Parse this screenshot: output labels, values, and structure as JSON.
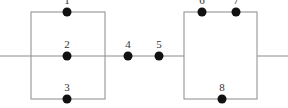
{
  "diagram": {
    "type": "reliability-block-network",
    "main_line_y": 56,
    "left_block": {
      "x1": 31,
      "x2": 105,
      "top": 12,
      "bottom": 99
    },
    "right_block": {
      "x1": 184,
      "x2": 257,
      "top": 12,
      "bottom": 99
    },
    "nodes": [
      {
        "id": "1",
        "label": "1",
        "x": 67,
        "y": 12
      },
      {
        "id": "2",
        "label": "2",
        "x": 67,
        "y": 56
      },
      {
        "id": "3",
        "label": "3",
        "x": 67,
        "y": 99
      },
      {
        "id": "4",
        "label": "4",
        "x": 128,
        "y": 56
      },
      {
        "id": "5",
        "label": "5",
        "x": 159,
        "y": 56
      },
      {
        "id": "6",
        "label": "6",
        "x": 202,
        "y": 12
      },
      {
        "id": "7",
        "label": "7",
        "x": 236,
        "y": 12
      },
      {
        "id": "8",
        "label": "8",
        "x": 222,
        "y": 99
      }
    ],
    "colors": {
      "wire": "#8a8a8a",
      "node": "#111111",
      "label": "#333333",
      "background": "#ffffff"
    }
  }
}
